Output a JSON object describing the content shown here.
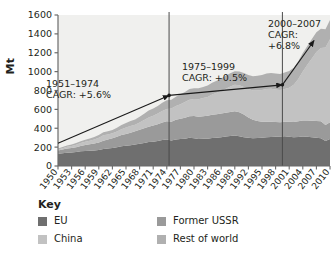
{
  "axis": {
    "ylabel": "Mt",
    "yticks": [
      "0",
      "200",
      "400",
      "600",
      "800",
      "1000",
      "1200",
      "1400",
      "1600"
    ],
    "xticks": [
      "1950",
      "1953",
      "1956",
      "1959",
      "1962",
      "1965",
      "1968",
      "1971",
      "1974",
      "1977",
      "1980",
      "1983",
      "1986",
      "1989",
      "1992",
      "1995",
      "1998",
      "2001",
      "2004",
      "2007",
      "2010"
    ]
  },
  "annotations": [
    {
      "id": "cagr-1951-1974",
      "line1": "1951–1974",
      "line2": "CAGR: +5.6%",
      "line3": ""
    },
    {
      "id": "cagr-1975-1999",
      "line1": "1975–1999",
      "line2": "CAGR: +0.5%",
      "line3": ""
    },
    {
      "id": "cagr-2000-2007",
      "line1": "2000–2007",
      "line2": "CAGR:",
      "line3": "+6.8%"
    }
  ],
  "legend": {
    "title": "Key",
    "items": [
      {
        "label": "EU",
        "color": "#6f6f6f"
      },
      {
        "label": "China",
        "color": "#c2c2c2"
      },
      {
        "label": "Former USSR",
        "color": "#9a9a9a"
      },
      {
        "label": "Rest of world",
        "color": "#b0b0b0"
      }
    ]
  },
  "colors": {
    "eu": "#6f6f6f",
    "former_ussr": "#9a9a9a",
    "china": "#c2c2c2",
    "rest_of_world": "#b0b0b0",
    "plot_background": "#f0f0ee",
    "axis": "#6b6b6b",
    "divider": "#4a4a4a",
    "arrow": "#1a1a1a"
  },
  "chart_data": {
    "type": "area",
    "stacked": true,
    "title": "",
    "xlabel": "",
    "ylabel": "Mt",
    "ylim": [
      0,
      1600
    ],
    "xlim": [
      1950,
      2010
    ],
    "grid": false,
    "legend_position": "below",
    "x": [
      1950,
      1951,
      1952,
      1953,
      1954,
      1955,
      1956,
      1957,
      1958,
      1959,
      1960,
      1961,
      1962,
      1963,
      1964,
      1965,
      1966,
      1967,
      1968,
      1969,
      1970,
      1971,
      1972,
      1973,
      1974,
      1975,
      1976,
      1977,
      1978,
      1979,
      1980,
      1981,
      1982,
      1983,
      1984,
      1985,
      1986,
      1987,
      1988,
      1989,
      1990,
      1991,
      1992,
      1993,
      1994,
      1995,
      1996,
      1997,
      1998,
      1999,
      2000,
      2001,
      2002,
      2003,
      2004,
      2005,
      2006,
      2007,
      2008,
      2009,
      2010
    ],
    "series": [
      {
        "name": "EU",
        "color": "#6f6f6f",
        "values": [
          130,
          135,
          140,
          142,
          148,
          155,
          160,
          162,
          165,
          170,
          180,
          185,
          192,
          200,
          210,
          215,
          220,
          228,
          235,
          245,
          255,
          258,
          265,
          275,
          280,
          270,
          282,
          285,
          290,
          300,
          295,
          285,
          288,
          290,
          298,
          300,
          305,
          312,
          318,
          322,
          315,
          305,
          300,
          295,
          298,
          300,
          305,
          308,
          310,
          312,
          315,
          310,
          305,
          308,
          312,
          310,
          305,
          300,
          295,
          265,
          285
        ]
      },
      {
        "name": "Former USSR",
        "color": "#9a9a9a",
        "values": [
          35,
          40,
          45,
          48,
          52,
          58,
          62,
          68,
          74,
          80,
          88,
          95,
          102,
          110,
          118,
          125,
          132,
          140,
          148,
          155,
          162,
          170,
          178,
          186,
          195,
          200,
          208,
          215,
          222,
          228,
          235,
          238,
          240,
          242,
          245,
          248,
          250,
          252,
          255,
          258,
          255,
          240,
          215,
          195,
          180,
          170,
          165,
          160,
          155,
          152,
          155,
          158,
          160,
          165,
          170,
          172,
          175,
          178,
          180,
          170,
          178
        ]
      },
      {
        "name": "China",
        "color": "#c2c2c2",
        "values": [
          10,
          14,
          18,
          22,
          26,
          30,
          35,
          38,
          42,
          50,
          58,
          55,
          52,
          56,
          62,
          68,
          72,
          70,
          78,
          88,
          98,
          105,
          112,
          122,
          130,
          138,
          145,
          155,
          165,
          175,
          180,
          185,
          192,
          200,
          215,
          228,
          240,
          255,
          270,
          280,
          285,
          292,
          300,
          310,
          322,
          335,
          345,
          350,
          345,
          340,
          345,
          360,
          395,
          450,
          520,
          590,
          660,
          730,
          775,
          820,
          880
        ]
      },
      {
        "name": "Rest of world",
        "color": "#b0b0b0",
        "values": [
          10,
          12,
          14,
          16,
          18,
          20,
          22,
          24,
          26,
          28,
          32,
          34,
          36,
          40,
          44,
          48,
          52,
          56,
          60,
          66,
          72,
          76,
          80,
          86,
          92,
          95,
          100,
          104,
          108,
          112,
          114,
          116,
          118,
          120,
          124,
          128,
          132,
          136,
          140,
          144,
          146,
          148,
          150,
          152,
          156,
          160,
          164,
          168,
          170,
          172,
          175,
          178,
          182,
          188,
          195,
          200,
          205,
          210,
          205,
          195,
          205
        ]
      }
    ],
    "trend_arrows": [
      {
        "id": "arrow-1951-1974",
        "from": {
          "x": 1950,
          "y": 240
        },
        "to": {
          "x": 1974.5,
          "y": 748
        },
        "cagr": "+5.6%",
        "period": "1951–1974"
      },
      {
        "id": "arrow-1975-1999",
        "from": {
          "x": 1974.5,
          "y": 748
        },
        "to": {
          "x": 1999.5,
          "y": 860
        },
        "cagr": "+0.5%",
        "period": "1975–1999"
      },
      {
        "id": "arrow-2000-2007",
        "from": {
          "x": 1999.5,
          "y": 860
        },
        "to": {
          "x": 2006.5,
          "y": 1330
        },
        "cagr": "+6.8%",
        "period": "2000–2007"
      }
    ],
    "dividers": [
      1974.5,
      1999.5
    ]
  }
}
